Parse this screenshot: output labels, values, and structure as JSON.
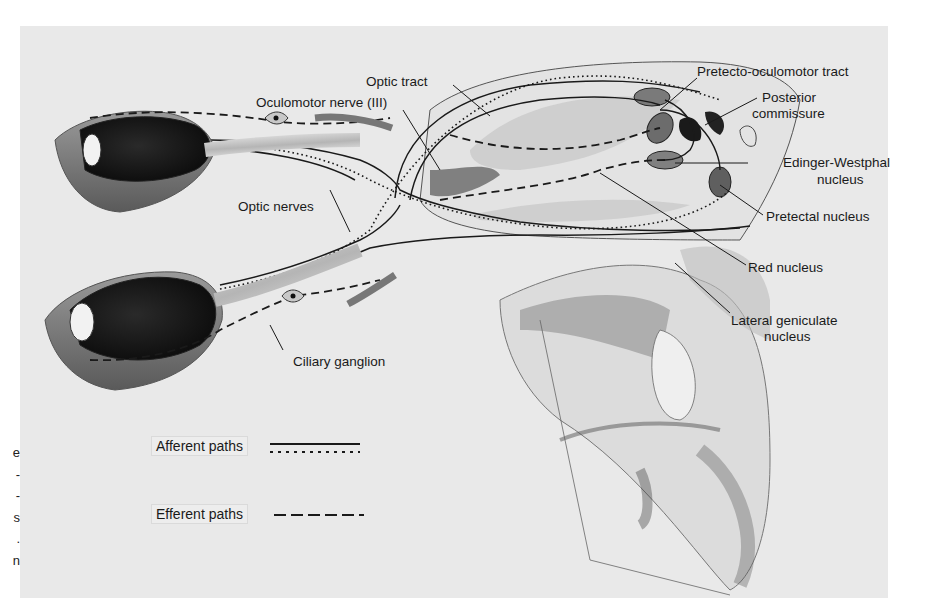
{
  "figure": {
    "background_color": "#e9e9e9",
    "ink_color": "#1a1a1a"
  },
  "margin_text": [
    "e",
    "-",
    "-",
    "s",
    ".",
    "n"
  ],
  "labels": {
    "optic_tract": "Optic tract",
    "oculomotor_nerve": "Oculomotor nerve (III)",
    "optic_nerves": "Optic nerves",
    "ciliary_ganglion": "Ciliary ganglion",
    "pretecto_oculomotor_tract": "Pretecto-oculomotor tract",
    "posterior_commissure_1": "Posterior",
    "posterior_commissure_2": "commissure",
    "edinger_westphal_1": "Edinger-Westphal",
    "edinger_westphal_2": "nucleus",
    "pretectal_nucleus": "Pretectal nucleus",
    "red_nucleus": "Red nucleus",
    "lateral_geniculate_1": "Lateral geniculate",
    "lateral_geniculate_2": "nucleus"
  },
  "legend": {
    "afferent": {
      "label": "Afferent paths",
      "styles": [
        "solid",
        "dotted"
      ]
    },
    "efferent": {
      "label": "Efferent paths",
      "styles": [
        "dashed"
      ]
    }
  }
}
